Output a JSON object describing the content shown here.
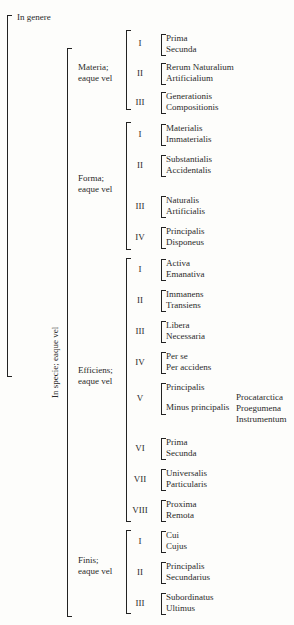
{
  "diagram": {
    "root": {
      "in_genere": "In genere",
      "in_specie": "In specie; eaque vel"
    },
    "categories": [
      {
        "label_line1": "Materia;",
        "label_line2": "eaque vel",
        "subdivisions": [
          {
            "numeral": "I",
            "terms": [
              "Prima",
              "Secunda"
            ]
          },
          {
            "numeral": "II",
            "terms": [
              "Rerum Naturalium",
              "Artificialium"
            ]
          },
          {
            "numeral": "III",
            "terms": [
              "Generationis",
              "Compositionis"
            ]
          }
        ]
      },
      {
        "label_line1": "Forma;",
        "label_line2": "eaque vel",
        "subdivisions": [
          {
            "numeral": "I",
            "terms": [
              "Materialis",
              "Immaterialis"
            ]
          },
          {
            "numeral": "II",
            "terms": [
              "Substantialis",
              "Accidentalis"
            ]
          },
          {
            "numeral": "III",
            "terms": [
              "Naturalis",
              "Artificialis"
            ]
          },
          {
            "numeral": "IV",
            "terms": [
              "Principalis",
              "Disponeus"
            ]
          }
        ]
      },
      {
        "label_line1": "Efficiens;",
        "label_line2": "eaque vel",
        "subdivisions": [
          {
            "numeral": "I",
            "terms": [
              "Activa",
              "Emanativa"
            ]
          },
          {
            "numeral": "II",
            "terms": [
              "Immanens",
              "Transiens"
            ]
          },
          {
            "numeral": "III",
            "terms": [
              "Libera",
              "Necessaria"
            ]
          },
          {
            "numeral": "IV",
            "terms": [
              "Per se",
              "Per accidens"
            ]
          },
          {
            "numeral": "V",
            "terms": [
              "Principalis",
              "Minus principalis"
            ],
            "minus_principalis_subterms": [
              "Procatarctica",
              "Proegumena",
              "Instrumentum"
            ]
          },
          {
            "numeral": "VI",
            "terms": [
              "Prima",
              "Secunda"
            ]
          },
          {
            "numeral": "VII",
            "terms": [
              "Universalis",
              "Particularis"
            ]
          },
          {
            "numeral": "VIII",
            "terms": [
              "Proxima",
              "Remota"
            ]
          }
        ]
      },
      {
        "label_line1": "Finis;",
        "label_line2": "eaque vel",
        "subdivisions": [
          {
            "numeral": "I",
            "terms": [
              "Cui",
              "Cujus"
            ]
          },
          {
            "numeral": "II",
            "terms": [
              "Principalis",
              "Secundarius"
            ]
          },
          {
            "numeral": "III",
            "terms": [
              "Subordinatus",
              "Ultimus"
            ]
          }
        ]
      }
    ]
  }
}
